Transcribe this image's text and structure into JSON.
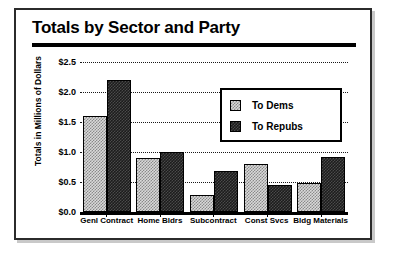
{
  "chart_data": {
    "type": "bar",
    "title": "Totals by Sector and Party",
    "xlabel": "",
    "ylabel": "Totals in Millions of Dollars",
    "ylim": [
      0.0,
      2.5
    ],
    "ytick_labels": [
      "$2.5",
      "$2.0",
      "$1.5",
      "$1.0",
      "$0.5",
      "$0.0"
    ],
    "ytick_values": [
      2.5,
      2.0,
      1.5,
      1.0,
      0.5,
      0.0
    ],
    "grid": true,
    "legend_position": "upper right",
    "categories": [
      "Genl Contract",
      "Home Bldrs",
      "Subcontract",
      "Const Svcs",
      "Bldg Materials"
    ],
    "series": [
      {
        "name": "To Dems",
        "values": [
          1.6,
          0.9,
          0.28,
          0.8,
          0.48
        ],
        "color": "#d9d9d9"
      },
      {
        "name": "To Repubs",
        "values": [
          2.2,
          1.0,
          0.68,
          0.45,
          0.92
        ],
        "color": "#1c1c1c"
      }
    ]
  },
  "legend": {
    "items": [
      {
        "label": "To Dems"
      },
      {
        "label": "To Repubs"
      }
    ]
  }
}
